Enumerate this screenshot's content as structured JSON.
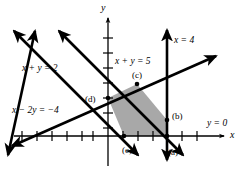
{
  "figure": {
    "type": "linear-programming-feasible-region",
    "background_color": "#ffffff",
    "line_color": "#000000",
    "axis_color": "#000000",
    "shade_color": "#a8a8a8",
    "axes": {
      "x_axis_label": "x",
      "y_axis_label": "y",
      "x_axis_pixel_y": 136,
      "y_axis_pixel_x": 108,
      "tick_spacing_px": 15,
      "x_ticks": [
        -5,
        -4,
        -3,
        -2,
        -1,
        1,
        2,
        3,
        4,
        5
      ],
      "y_ticks": [
        1,
        2,
        3,
        4,
        5
      ]
    },
    "constraint_lines": [
      {
        "id": "line-x-plus-y-2",
        "label": "x + y = 2",
        "equation_text": "x + y = 2",
        "slope": -1,
        "intercept": 2,
        "label_x": 22,
        "label_y": 64
      },
      {
        "id": "line-x-plus-y-5",
        "label": "x + y = 5",
        "equation_text": "x + y = 5",
        "slope": -1,
        "intercept": 5,
        "label_x": 115,
        "label_y": 57
      },
      {
        "id": "line-x-minus-2y-neg4",
        "label": "x - 2y = -4",
        "equation_text": "x − 2y = −4",
        "slope": 0.5,
        "intercept": 2,
        "label_x": 12,
        "label_y": 106
      },
      {
        "id": "line-x-4",
        "label": "x = 4",
        "equation_text": "x = 4",
        "vertical_at_x": 4,
        "label_x": 174,
        "label_y": 36
      },
      {
        "id": "line-y-0",
        "label": "y = 0",
        "equation_text": "y = 0",
        "horizontal_at_y": 0,
        "label_x": 207,
        "label_y": 119
      }
    ],
    "vertices": [
      {
        "id": "vertex-a",
        "label": "(a)",
        "label_x": 168,
        "label_y": 148
      },
      {
        "id": "vertex-b",
        "label": "(b)",
        "label_x": 172,
        "label_y": 112
      },
      {
        "id": "vertex-c",
        "label": "(c)",
        "label_x": 132,
        "label_y": 71
      },
      {
        "id": "vertex-d",
        "label": "(d)",
        "label_x": 85,
        "label_y": 95
      },
      {
        "id": "vertex-e",
        "label": "(e)",
        "label_x": 122,
        "label_y": 146
      }
    ],
    "shaded_region": {
      "id": "feasible-region",
      "fill": "#a8a8a8",
      "polygon_points": "108,98 137,84 167,120 167,136 124,136"
    }
  }
}
